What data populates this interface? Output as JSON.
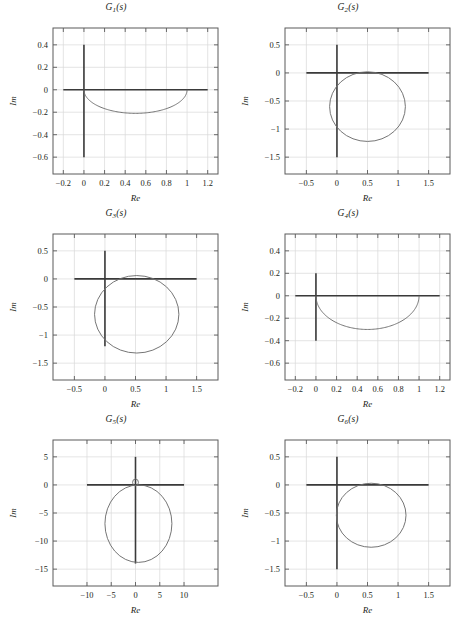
{
  "figure": {
    "background": "#ffffff",
    "curve_color": "#6e6e6e",
    "axis_color": "#3a3a3a",
    "frame_color": "#5b5b5b",
    "grid_color": "#d9d9d9",
    "columns": 2,
    "rows": 3
  },
  "chart_data": [
    {
      "type": "line",
      "id": "G1",
      "title": "G₁(s)",
      "title_base": "G",
      "title_sub": "1",
      "title_tail": "(s)",
      "xlabel": "Re",
      "ylabel": "Im",
      "grid": true,
      "legend": "none",
      "xlim": [
        -0.3,
        1.3
      ],
      "ylim": [
        -0.75,
        0.55
      ],
      "xticks": [
        -0.2,
        0,
        0.2,
        0.4,
        0.6,
        0.8,
        1,
        1.2
      ],
      "xticklabels": [
        "−0.2",
        "0",
        "0.2",
        "0.4",
        "0.6",
        "0.8",
        "1",
        "1.2"
      ],
      "yticks": [
        -0.6,
        -0.4,
        -0.2,
        0,
        0.2,
        0.4
      ],
      "yticklabels": [
        "−0.6",
        "−0.4",
        "−0.2",
        "0",
        "0.2",
        "0.4"
      ],
      "axis_vertical": {
        "x": 0,
        "y_from": 0.4,
        "y_to": -0.6
      },
      "axis_horizontal": {
        "y": 0,
        "x_from": -0.2,
        "x_to": 1.2
      },
      "arc": {
        "shape": "lower-arc",
        "x_from": 0,
        "x_to": 1.0,
        "y_peak": -0.21,
        "y_ends": 0
      }
    },
    {
      "type": "line",
      "id": "G2",
      "title": "G₂(s)",
      "title_base": "G",
      "title_sub": "2",
      "title_tail": "(s)",
      "xlabel": "Re",
      "ylabel": "Im",
      "grid": true,
      "legend": "none",
      "xlim": [
        -0.85,
        1.85
      ],
      "ylim": [
        -1.8,
        0.8
      ],
      "xticks": [
        -0.5,
        0,
        0.5,
        1,
        1.5
      ],
      "xticklabels": [
        "−0.5",
        "0",
        "0.5",
        "1",
        "1.5"
      ],
      "yticks": [
        -1.5,
        -1,
        -0.5,
        0,
        0.5
      ],
      "yticklabels": [
        "−1.5",
        "−1",
        "−0.5",
        "0",
        "0.5"
      ],
      "axis_vertical": {
        "x": 0,
        "y_from": 0.5,
        "y_to": -1.5
      },
      "axis_horizontal": {
        "y": 0,
        "x_from": -0.5,
        "x_to": 1.5
      },
      "circle": {
        "cx": 0.5,
        "cy": -0.6,
        "r": 0.62
      }
    },
    {
      "type": "line",
      "id": "G3",
      "title": "G₃(s)",
      "title_base": "G",
      "title_sub": "3",
      "title_tail": "(s)",
      "xlabel": "Re",
      "ylabel": "Im",
      "grid": true,
      "legend": "none",
      "xlim": [
        -0.85,
        1.85
      ],
      "ylim": [
        -1.8,
        0.8
      ],
      "xticks": [
        -0.5,
        0,
        0.5,
        1,
        1.5
      ],
      "xticklabels": [
        "−0.5",
        "0",
        "0.5",
        "1",
        "1.5"
      ],
      "yticks": [
        -1.5,
        -1,
        -0.5,
        0,
        0.5
      ],
      "yticklabels": [
        "−1.5",
        "−1",
        "−0.5",
        "0",
        "0.5"
      ],
      "axis_vertical": {
        "x": 0,
        "y_from": 0.5,
        "y_to": -1.2
      },
      "axis_horizontal": {
        "y": 0,
        "x_from": -0.5,
        "x_to": 1.5
      },
      "circle": {
        "cx": 0.52,
        "cy": -0.63,
        "r": 0.69
      }
    },
    {
      "type": "line",
      "id": "G4",
      "title": "G₄(s)",
      "title_base": "G",
      "title_sub": "4",
      "title_tail": "(s)",
      "xlabel": "Re",
      "ylabel": "Im",
      "grid": true,
      "legend": "none",
      "xlim": [
        -0.3,
        1.3
      ],
      "ylim": [
        -0.75,
        0.55
      ],
      "xticks": [
        -0.2,
        0,
        0.2,
        0.4,
        0.6,
        0.8,
        1,
        1.2
      ],
      "xticklabels": [
        "−0.2",
        "0",
        "0.2",
        "0.4",
        "0.6",
        "0.8",
        "1",
        "1.2"
      ],
      "yticks": [
        -0.6,
        -0.4,
        -0.2,
        0,
        0.2,
        0.4
      ],
      "yticklabels": [
        "−0.6",
        "−0.4",
        "−0.2",
        "0",
        "0.2",
        "0.4"
      ],
      "axis_vertical": {
        "x": 0,
        "y_from": 0.2,
        "y_to": -0.4
      },
      "axis_horizontal": {
        "y": 0,
        "x_from": -0.2,
        "x_to": 1.2
      },
      "arc": {
        "shape": "lower-arc",
        "x_from": 0,
        "x_to": 1.0,
        "y_peak": -0.3,
        "y_ends": 0
      }
    },
    {
      "type": "line",
      "id": "G5",
      "title": "G₅(s)",
      "title_base": "G",
      "title_sub": "5",
      "title_tail": "(s)",
      "xlabel": "Re",
      "ylabel": "Im",
      "grid": true,
      "legend": "none",
      "xlim": [
        -17,
        17
      ],
      "ylim": [
        -18,
        8
      ],
      "xticks": [
        -10,
        -5,
        0,
        5,
        10
      ],
      "xticklabels": [
        "−10",
        "−5",
        "0",
        "5",
        "10"
      ],
      "yticks": [
        -15,
        -10,
        -5,
        0,
        5
      ],
      "yticklabels": [
        "−15",
        "−10",
        "−5",
        "0",
        "5"
      ],
      "axis_vertical": {
        "x": 0,
        "y_from": 5,
        "y_to": -14
      },
      "axis_horizontal": {
        "y": 0,
        "x_from": -10,
        "x_to": 10
      },
      "circle": {
        "cx": 0.6,
        "cy": -6.9,
        "r": 6.9
      },
      "small_loop": {
        "cx": 0.0,
        "cy": 0.45,
        "r": 0.6
      }
    },
    {
      "type": "line",
      "id": "G6",
      "title": "G₆(s)",
      "title_base": "G",
      "title_sub": "6",
      "title_tail": "(s)",
      "xlabel": "Re",
      "ylabel": "Im",
      "grid": true,
      "legend": "none",
      "xlim": [
        -0.85,
        1.85
      ],
      "ylim": [
        -1.8,
        0.8
      ],
      "xticks": [
        -0.5,
        0,
        0.5,
        1,
        1.5
      ],
      "xticklabels": [
        "−0.5",
        "0",
        "0.5",
        "1",
        "1.5"
      ],
      "yticks": [
        -1.5,
        -1,
        -0.5,
        0,
        0.5
      ],
      "yticklabels": [
        "−1.5",
        "−1",
        "−0.5",
        "0",
        "0.5"
      ],
      "axis_vertical": {
        "x": 0,
        "y_from": 0.5,
        "y_to": -1.5
      },
      "axis_horizontal": {
        "y": 0,
        "x_from": -0.5,
        "x_to": 1.5
      },
      "circle": {
        "cx": 0.56,
        "cy": -0.54,
        "r": 0.57
      }
    }
  ]
}
